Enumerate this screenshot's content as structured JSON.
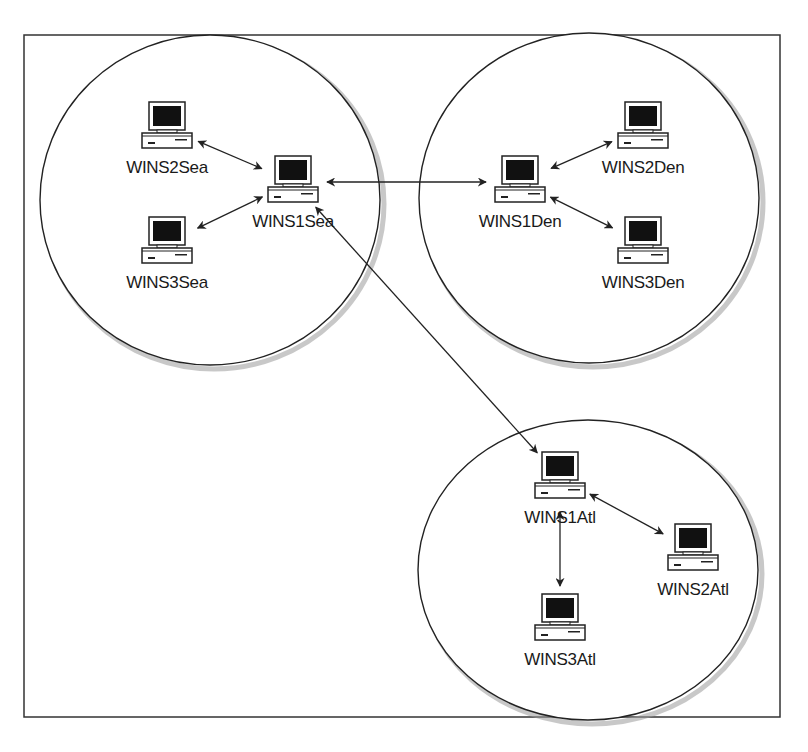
{
  "diagram": {
    "type": "network-topology",
    "colors": {
      "line": "#222222",
      "screen": "#111111",
      "shadow": "#9a9a9a",
      "background": "#ffffff"
    },
    "sites": [
      {
        "id": "sea",
        "name": "Seattle",
        "cx": 210,
        "cy": 200,
        "rx": 170,
        "ry": 165
      },
      {
        "id": "den",
        "name": "Denver",
        "cx": 589,
        "cy": 198,
        "rx": 170,
        "ry": 165
      },
      {
        "id": "atl",
        "name": "Atlanta",
        "cx": 588,
        "cy": 570,
        "rx": 170,
        "ry": 150
      }
    ],
    "nodes": [
      {
        "id": "WINS2Sea",
        "label": "WINS2Sea",
        "x": 167,
        "y": 128,
        "site": "sea"
      },
      {
        "id": "WINS1Sea",
        "label": "WINS1Sea",
        "x": 293,
        "y": 182,
        "site": "sea"
      },
      {
        "id": "WINS3Sea",
        "label": "WINS3Sea",
        "x": 167,
        "y": 243,
        "site": "sea"
      },
      {
        "id": "WINS1Den",
        "label": "WINS1Den",
        "x": 520,
        "y": 182,
        "site": "den"
      },
      {
        "id": "WINS2Den",
        "label": "WINS2Den",
        "x": 643,
        "y": 128,
        "site": "den"
      },
      {
        "id": "WINS3Den",
        "label": "WINS3Den",
        "x": 643,
        "y": 243,
        "site": "den"
      },
      {
        "id": "WINS1Atl",
        "label": "WINS1Atl",
        "x": 560,
        "y": 478,
        "site": "atl"
      },
      {
        "id": "WINS2Atl",
        "label": "WINS2Atl",
        "x": 693,
        "y": 550,
        "site": "atl"
      },
      {
        "id": "WINS3Atl",
        "label": "WINS3Atl",
        "x": 560,
        "y": 620,
        "site": "atl"
      }
    ],
    "links": [
      {
        "from": "WINS2Sea",
        "to": "WINS1Sea",
        "bidirectional": true
      },
      {
        "from": "WINS3Sea",
        "to": "WINS1Sea",
        "bidirectional": true
      },
      {
        "from": "WINS1Sea",
        "to": "WINS1Den",
        "bidirectional": true
      },
      {
        "from": "WINS1Sea",
        "to": "WINS1Atl",
        "bidirectional": true
      },
      {
        "from": "WINS1Den",
        "to": "WINS2Den",
        "bidirectional": true
      },
      {
        "from": "WINS1Den",
        "to": "WINS3Den",
        "bidirectional": true
      },
      {
        "from": "WINS1Atl",
        "to": "WINS2Atl",
        "bidirectional": true
      },
      {
        "from": "WINS1Atl",
        "to": "WINS3Atl",
        "bidirectional": true
      }
    ]
  }
}
